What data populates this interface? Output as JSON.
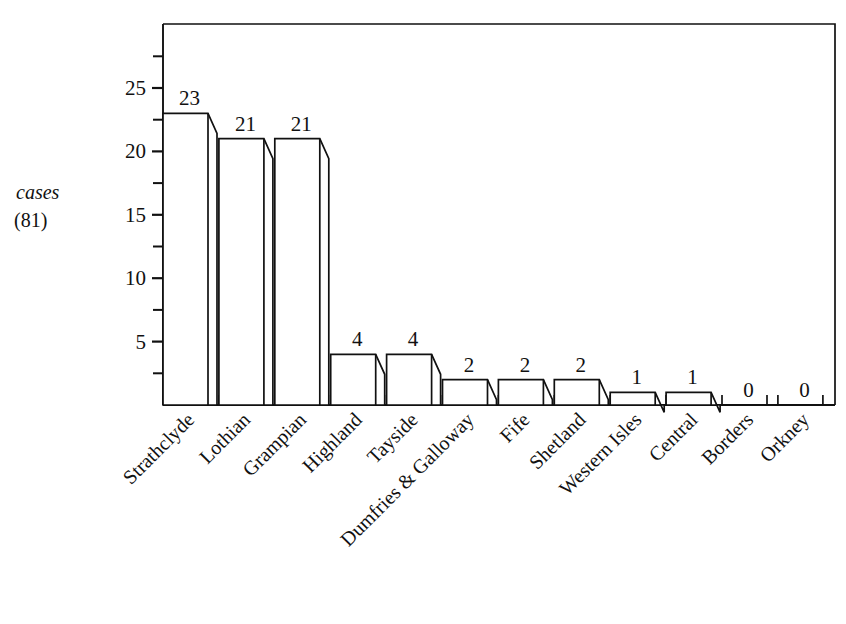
{
  "chart_data": {
    "type": "bar",
    "title": "",
    "subtitle": "",
    "xlabel": "",
    "ylabel": "cases",
    "ylabel_line2": "(81)",
    "categories": [
      "Strathclyde",
      "Lothian",
      "Grampian",
      "Highland",
      "Tayside",
      "Dumfries & Galloway",
      "Fife",
      "Shetland",
      "Western Isles",
      "Central",
      "Borders",
      "Orkney"
    ],
    "values": [
      23,
      21,
      21,
      4,
      4,
      2,
      2,
      2,
      1,
      1,
      0,
      0
    ],
    "value_labels": [
      "23",
      "21",
      "21",
      "4",
      "4",
      "2",
      "2",
      "2",
      "1",
      "1",
      "0",
      "0"
    ],
    "ylim": [
      0,
      28.5
    ],
    "y_major_ticks": [
      5,
      10,
      15,
      20,
      25
    ],
    "y_major_tick_labels": [
      "5",
      "10",
      "15",
      "20",
      "25"
    ],
    "y_minor_ticks": [
      2.5,
      7.5,
      12.5,
      17.5,
      22.5,
      27.5
    ],
    "grid": false,
    "legend": "none",
    "total": 81,
    "style": "pseudo-3d-outline-bars",
    "colors": {
      "background": "#ffffff",
      "bar_fill": "#ffffff",
      "bar_stroke": "#111111",
      "axis": "#111111",
      "text": "#111111"
    }
  }
}
